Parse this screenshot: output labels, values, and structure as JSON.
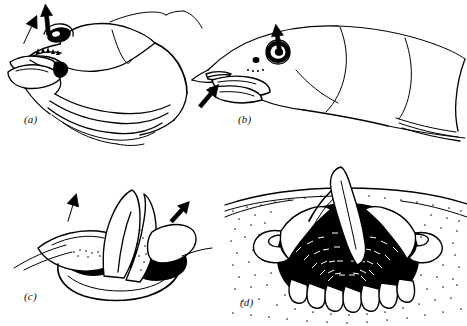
{
  "figure": {
    "background_color": "#ffffff",
    "ink_color": "#000000",
    "width": 467,
    "height": 326,
    "style": "black-and-white scientific line drawing"
  },
  "panels": [
    {
      "id": "a",
      "label": "(a)",
      "subject": "fish head, oblique frontal view with mouth open and opercular series expanded",
      "label_x": 24,
      "label_y": 120,
      "arrows": [
        {
          "name": "arrow-down-left-snout",
          "direction": "down-left",
          "x": 22,
          "y": 18,
          "angle": 205
        },
        {
          "name": "arrow-up-head",
          "direction": "up",
          "x": 44,
          "y": 8,
          "angle": 355
        }
      ],
      "features": [
        "eye",
        "open jaw",
        "teeth",
        "operculum",
        "branchiostegal rays"
      ]
    },
    {
      "id": "b",
      "label": "(b)",
      "subject": "fish head, lateral view with mouth closed",
      "label_x": 238,
      "label_y": 120,
      "arrows": [
        {
          "name": "arrow-up-eye",
          "direction": "up",
          "x": 276,
          "y": 32,
          "angle": 352
        },
        {
          "name": "arrow-up-right-jaw",
          "direction": "up-right",
          "x": 204,
          "y": 88,
          "angle": 40
        }
      ],
      "features": [
        "eye",
        "nostril",
        "lower jaw",
        "operculum",
        "pectoral region"
      ]
    },
    {
      "id": "c",
      "label": "(c)",
      "subject": "detail of opercular flap and branchiostegal membrane, dark cavity visible",
      "label_x": 24,
      "label_y": 292,
      "arrows": [
        {
          "name": "arrow-down-left-opercular",
          "direction": "down",
          "x": 62,
          "y": 196,
          "angle": 200
        },
        {
          "name": "arrow-up-right-opercular",
          "direction": "up-right",
          "x": 168,
          "y": 196,
          "angle": 42
        }
      ],
      "features": [
        "opercular valve",
        "dark buccal cavity",
        "membrane fold"
      ]
    },
    {
      "id": "d",
      "label": "(d)",
      "subject": "cutaway section through buccal cavity showing gill arches and filaments",
      "label_x": 240,
      "label_y": 296,
      "arrows": [],
      "features": [
        "gill arch",
        "gill filaments",
        "lamellae",
        "stippled tissue",
        "buccal cavity"
      ]
    }
  ]
}
